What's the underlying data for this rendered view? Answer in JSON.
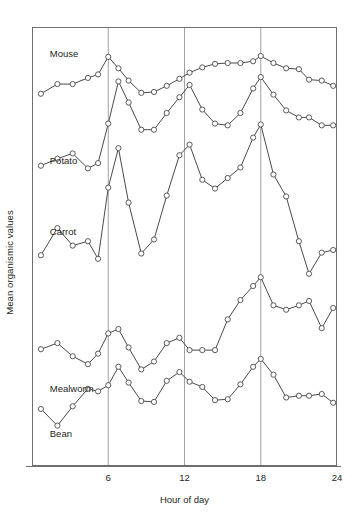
{
  "chart_data": {
    "type": "line",
    "title": "",
    "xlabel": "Hour of day",
    "ylabel": "Mean organismic values",
    "xlim": [
      0,
      24
    ],
    "ylim": [
      0,
      100
    ],
    "grid": "vertical gridlines at 6, 12, 18",
    "xticks": [
      6,
      12,
      18,
      24
    ],
    "xticklabels": [
      "6",
      "12",
      "18",
      "24"
    ],
    "yticks": [],
    "yticklabels": [],
    "legend_position": "inline labels at left of each curve",
    "marker": "open circle",
    "line_color": "#4a4a4a",
    "marker_face_color": "#ffffff",
    "note": "Five vertically offset time series of mean organismic values across a 24 hour day; y axis is unitless/unscaled.",
    "series": [
      {
        "name": "Mouse",
        "label_x_hour": 1.4,
        "x": [
          0.7,
          2.0,
          3.2,
          4.4,
          5.2,
          6.0,
          6.8,
          7.6,
          8.6,
          9.6,
          10.6,
          11.6,
          12.4,
          13.4,
          14.4,
          15.4,
          16.4,
          17.4,
          18.0,
          19.0,
          20.0,
          21.0,
          21.8,
          22.8,
          23.7
        ],
        "values": [
          84.8,
          87.0,
          87.0,
          88.4,
          89.2,
          93.2,
          90.6,
          87.8,
          85.0,
          85.2,
          86.6,
          88.2,
          89.6,
          90.8,
          91.6,
          91.8,
          91.8,
          92.2,
          93.4,
          91.8,
          90.6,
          90.4,
          88.0,
          87.8,
          86.6
        ]
      },
      {
        "name": "Potato",
        "label_x_hour": 1.4,
        "x": [
          0.7,
          2.0,
          3.2,
          4.4,
          5.2,
          6.0,
          6.8,
          7.6,
          8.6,
          9.6,
          10.6,
          11.6,
          12.4,
          13.4,
          14.4,
          15.4,
          16.4,
          17.4,
          18.0,
          19.0,
          20.0,
          21.0,
          21.8,
          22.8,
          23.7
        ],
        "values": [
          68.4,
          70.0,
          71.2,
          67.8,
          69.0,
          78.0,
          87.6,
          82.8,
          76.6,
          76.6,
          80.4,
          84.0,
          86.8,
          81.2,
          78.0,
          77.6,
          80.4,
          86.0,
          88.6,
          84.6,
          81.0,
          79.4,
          79.4,
          77.6,
          77.6
        ]
      },
      {
        "name": "Carrot",
        "label_x_hour": 1.4,
        "x": [
          0.7,
          2.0,
          3.2,
          4.4,
          5.2,
          6.0,
          6.8,
          7.6,
          8.6,
          9.6,
          10.6,
          11.6,
          12.4,
          13.4,
          14.4,
          15.4,
          16.4,
          17.4,
          18.0,
          19.0,
          20.0,
          21.0,
          21.8,
          22.8,
          23.7
        ],
        "values": [
          48.0,
          54.2,
          50.2,
          51.2,
          47.2,
          63.4,
          72.4,
          60.0,
          48.4,
          51.6,
          61.6,
          70.8,
          73.2,
          65.2,
          63.2,
          65.6,
          68.0,
          74.8,
          77.8,
          66.4,
          61.4,
          51.2,
          43.8,
          48.6,
          49.2
        ]
      },
      {
        "name": "Mealworm",
        "label_x_hour": 1.4,
        "x": [
          0.7,
          2.0,
          3.2,
          4.4,
          5.2,
          6.0,
          6.8,
          7.6,
          8.6,
          9.6,
          10.6,
          11.6,
          12.4,
          13.4,
          14.4,
          15.4,
          16.4,
          17.4,
          18.0,
          19.0,
          20.0,
          21.0,
          21.8,
          22.8,
          23.7
        ],
        "values": [
          26.6,
          28.0,
          25.0,
          23.2,
          25.6,
          30.2,
          31.2,
          27.0,
          22.0,
          23.8,
          28.0,
          29.2,
          26.4,
          26.4,
          26.4,
          33.4,
          37.8,
          41.0,
          43.0,
          36.6,
          35.6,
          36.6,
          37.6,
          31.4,
          36.0
        ]
      },
      {
        "name": "Bean",
        "label_x_hour": 1.4,
        "x": [
          0.7,
          2.0,
          3.2,
          4.4,
          5.2,
          6.0,
          6.8,
          7.6,
          8.6,
          9.6,
          10.6,
          11.6,
          12.4,
          13.4,
          14.4,
          15.4,
          16.4,
          17.4,
          18.0,
          19.0,
          20.0,
          21.0,
          21.8,
          22.8,
          23.7
        ],
        "values": [
          13.0,
          9.2,
          13.6,
          17.6,
          17.0,
          18.4,
          22.6,
          19.0,
          14.8,
          14.6,
          19.4,
          21.4,
          19.2,
          18.0,
          15.0,
          15.2,
          18.6,
          22.6,
          24.4,
          20.8,
          15.6,
          16.0,
          16.0,
          16.4,
          14.4
        ]
      }
    ]
  },
  "axes": {
    "border_color": "#6f6f6f",
    "grid_color": "#8a8a8a"
  }
}
